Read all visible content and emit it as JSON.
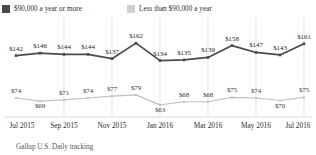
{
  "legend": {
    "items": [
      {
        "label": "$90,000 a year or more",
        "color": "#4a4a4a",
        "swatch": "square-marker-icon"
      },
      {
        "label": "Less than $90,000 a year",
        "color": "#cfcfcf",
        "swatch": "square-marker-icon"
      }
    ]
  },
  "footer": {
    "source": "Gallup U.S. Daily tracking"
  },
  "chart_data": {
    "type": "line",
    "title": "",
    "subtitle": "",
    "xlabel": "",
    "ylabel": "",
    "grid": "vertical",
    "legend_position": "top-left",
    "x": [
      "Jul 2015",
      "Aug 2015",
      "Sep 2015",
      "Oct 2015",
      "Nov 2015",
      "Dec 2015",
      "Jan 2016",
      "Feb 2016",
      "Mar 2016",
      "Apr 2016",
      "May 2016",
      "Jun 2016",
      "Jul 2016"
    ],
    "tick_labels": [
      "Jul 2015",
      "Sep 2015",
      "Nov 2015",
      "Jan 2016",
      "Mar 2016",
      "May 2016",
      "Jul 2016"
    ],
    "tick_indices": [
      0,
      2,
      4,
      6,
      8,
      10,
      12
    ],
    "ylim": [
      50,
      175
    ],
    "series": [
      {
        "name": "$90,000 a year or more",
        "color": "#4a4a4a",
        "values": [
          142,
          146,
          144,
          144,
          137,
          162,
          134,
          135,
          139,
          158,
          147,
          143,
          161
        ],
        "labels": [
          "$142",
          "$146",
          "$144",
          "$144",
          "$137",
          "$162",
          "$134",
          "$135",
          "$139",
          "$158",
          "$147",
          "$143",
          "$161"
        ]
      },
      {
        "name": "Less than $90,000 a year",
        "color": "#c0c0c0",
        "values": [
          74,
          69,
          71,
          74,
          77,
          79,
          63,
          68,
          68,
          75,
          74,
          70,
          75
        ],
        "labels": [
          "$74",
          "$69",
          "$71",
          "$74",
          "$77",
          "$79",
          "$63",
          "$68",
          "$68",
          "$75",
          "$74",
          "$70",
          "$75"
        ]
      }
    ]
  }
}
